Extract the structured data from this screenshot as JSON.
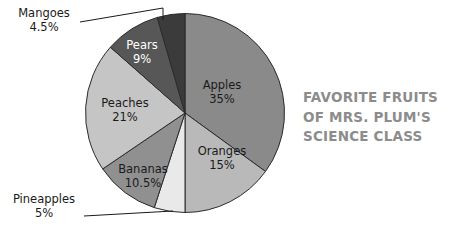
{
  "chart_data": {
    "type": "pie",
    "title": "FAVORITE FRUITS OF MRS. PLUM'S SCIENCE CLASS",
    "title_lines": [
      "FAVORITE FRUITS",
      "OF MRS. PLUM'S",
      "SCIENCE CLASS"
    ],
    "categories": [
      "Apples",
      "Oranges",
      "Pineapples",
      "Bananas",
      "Peaches",
      "Pears",
      "Mangoes"
    ],
    "values": [
      35,
      15,
      5,
      10.5,
      21,
      9,
      4.5
    ],
    "value_labels": [
      "35%",
      "15%",
      "5%",
      "10.5%",
      "21%",
      "9%",
      "4.5%"
    ],
    "units": "percent",
    "start_angle_deg": 0,
    "direction": "clockwise",
    "legend": "none",
    "grid": false,
    "xlabel": "",
    "ylabel": "",
    "slices": [
      {
        "name": "Apples",
        "value": 35,
        "value_label": "35%",
        "color": "#8a8a8a",
        "label_placement": "inside",
        "label_x": 222,
        "label_y": 92,
        "label_on_dark": false
      },
      {
        "name": "Oranges",
        "value": 15,
        "value_label": "15%",
        "color": "#b9b9b9",
        "label_placement": "inside",
        "label_x": 222,
        "label_y": 158,
        "label_on_dark": false
      },
      {
        "name": "Pineapples",
        "value": 5,
        "value_label": "5%",
        "color": "#e9e9e9",
        "label_placement": "callout",
        "label_x": 44,
        "label_y": 206,
        "label_on_dark": false
      },
      {
        "name": "Bananas",
        "value": 10.5,
        "value_label": "10.5%",
        "color": "#909090",
        "label_placement": "inside",
        "label_x": 143,
        "label_y": 176,
        "label_on_dark": false
      },
      {
        "name": "Peaches",
        "value": 21,
        "value_label": "21%",
        "color": "#c5c5c5",
        "label_placement": "inside",
        "label_x": 125,
        "label_y": 110,
        "label_on_dark": false
      },
      {
        "name": "Pears",
        "value": 9,
        "value_label": "9%",
        "color": "#575757",
        "label_placement": "inside",
        "label_x": 142,
        "label_y": 52,
        "label_on_dark": true
      },
      {
        "name": "Mangoes",
        "value": 4.5,
        "value_label": "4.5%",
        "color": "#3b3b3b",
        "label_placement": "callout",
        "label_x": 44,
        "label_y": 20,
        "label_on_dark": false
      }
    ]
  }
}
